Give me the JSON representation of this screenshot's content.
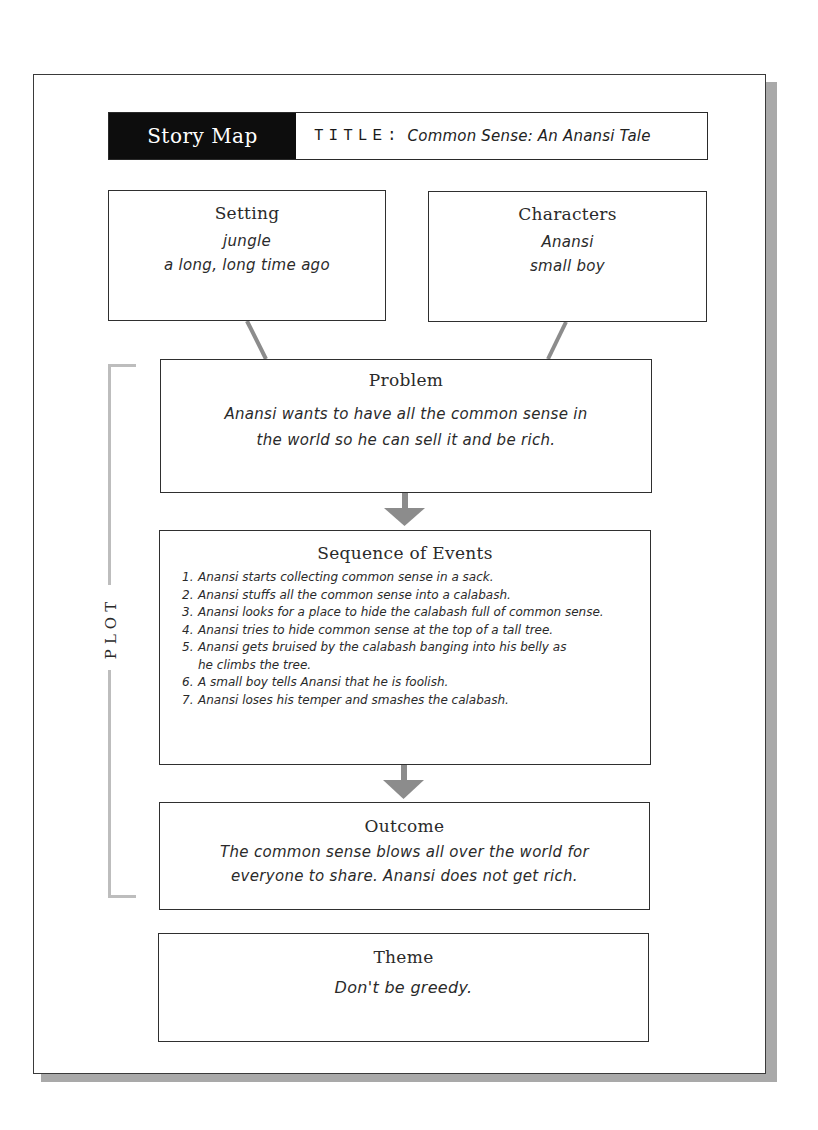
{
  "header": {
    "badge": "Story Map",
    "title_label": "TITLE:",
    "title_value": "Common Sense: An Anansi Tale"
  },
  "setting": {
    "heading": "Setting",
    "lines": [
      "jungle",
      "a long, long time ago"
    ]
  },
  "characters": {
    "heading": "Characters",
    "lines": [
      "Anansi",
      "small boy"
    ]
  },
  "plot": {
    "label": "PLOT",
    "problem": {
      "heading": "Problem",
      "lines": [
        "Anansi wants to have all the common sense in",
        "the world so he can sell it and be rich."
      ]
    },
    "sequence": {
      "heading": "Sequence of Events",
      "events": [
        {
          "num": "1.",
          "text": "Anansi starts collecting common sense in a sack."
        },
        {
          "num": "2.",
          "text": "Anansi stuffs all the common sense into a calabash."
        },
        {
          "num": "3.",
          "text": "Anansi looks for a place to hide the calabash full of common sense."
        },
        {
          "num": "4.",
          "text": "Anansi tries to hide common sense at the top of a tall tree."
        },
        {
          "num": "5.",
          "text": "Anansi gets bruised by the calabash banging into his belly as he climbs the tree."
        },
        {
          "num": "6.",
          "text": "A small boy tells Anansi that he is foolish."
        },
        {
          "num": "7.",
          "text": "Anansi loses his temper and smashes the calabash."
        }
      ]
    },
    "outcome": {
      "heading": "Outcome",
      "lines": [
        "The common sense blows all over the world for",
        "everyone to share. Anansi does not get rich."
      ]
    }
  },
  "theme": {
    "heading": "Theme",
    "lines": [
      "Don't be greedy."
    ]
  },
  "colors": {
    "badge_bg": "#0d0d0d",
    "border": "#2f2f2f",
    "connector": "#8c8c8c",
    "bracket": "#bdbdbd",
    "shadow": "#a9a9a9"
  }
}
